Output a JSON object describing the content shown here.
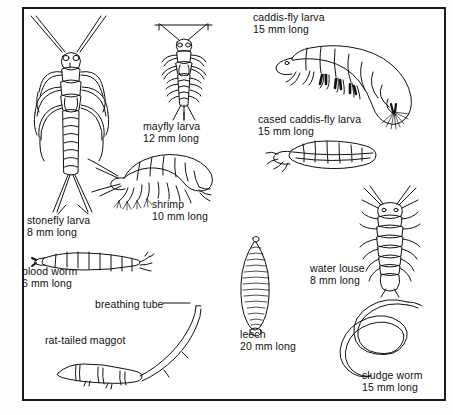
{
  "figure": {
    "background_color": "#ffffff",
    "border_color": "#1b1b1b",
    "ink_color": "#111111",
    "caption": ""
  },
  "organisms": [
    {
      "id": "stonefly",
      "icon": "stonefly-larva-illustration",
      "name": "stonefly larva",
      "size": "8 mm long"
    },
    {
      "id": "mayfly",
      "icon": "mayfly-larva-illustration",
      "name": "mayfly larva",
      "size": "12 mm long"
    },
    {
      "id": "caddis",
      "icon": "caddis-fly-larva-illustration",
      "name": "caddis-fly larva",
      "size": "15 mm long"
    },
    {
      "id": "casedcaddis",
      "icon": "cased-caddis-fly-larva-illustration",
      "name": "cased caddis-fly larva",
      "size": "15 mm long"
    },
    {
      "id": "shrimp",
      "icon": "freshwater-shrimp-illustration",
      "name": "shrimp",
      "size": "10 mm long"
    },
    {
      "id": "bloodworm",
      "icon": "blood-worm-illustration",
      "name": "blood worm",
      "size": "6 mm long"
    },
    {
      "id": "waterlouse",
      "icon": "water-louse-illustration",
      "name": "water louse",
      "size": "8 mm long"
    },
    {
      "id": "ratmaggot",
      "icon": "rat-tailed-maggot-illustration",
      "name": "rat-tailed maggot",
      "size": ""
    },
    {
      "id": "leech",
      "icon": "leech-illustration",
      "name": "leech",
      "size": "20 mm long"
    },
    {
      "id": "sludge",
      "icon": "sludge-worm-illustration",
      "name": "sludge worm",
      "size": "15 mm long"
    }
  ],
  "annotations": [
    {
      "id": "breathing",
      "name": "breathing tube",
      "size": ""
    }
  ]
}
